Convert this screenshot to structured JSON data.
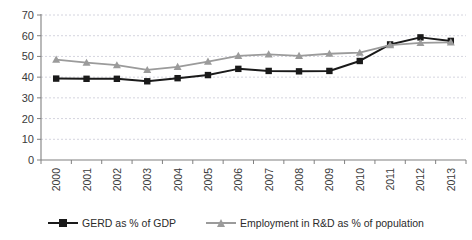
{
  "chart_data": {
    "type": "line",
    "title": "",
    "subtitle": "",
    "xlabel": "",
    "ylabel": "",
    "categories": [
      "2000",
      "2001",
      "2002",
      "2003",
      "2004",
      "2005",
      "2006",
      "2007",
      "2008",
      "2009",
      "2010",
      "2011",
      "2012",
      "2013"
    ],
    "x": [
      2000,
      2001,
      2002,
      2003,
      2004,
      2005,
      2006,
      2007,
      2008,
      2009,
      2010,
      2011,
      2012,
      2013
    ],
    "ylim": [
      0,
      70
    ],
    "yticks": [
      0,
      10,
      20,
      30,
      40,
      50,
      60,
      70
    ],
    "ytick_labels": [
      "0",
      "10",
      "20",
      "30",
      "40",
      "50",
      "60",
      "70"
    ],
    "grid": true,
    "grid_axis": "y",
    "legend_position": "bottom",
    "series": [
      {
        "name": "GERD as % of GDP",
        "color": "#1a1a1a",
        "marker": "square",
        "values": [
          39.3,
          39.2,
          39.2,
          38.0,
          39.5,
          41.0,
          44.0,
          43.0,
          42.8,
          43.0,
          47.8,
          55.8,
          59.2,
          57.5
        ]
      },
      {
        "name": "Employment in R&D as % of population",
        "color": "#9b9b9b",
        "marker": "triangle",
        "values": [
          48.5,
          47.0,
          45.8,
          43.5,
          45.0,
          47.5,
          50.3,
          51.0,
          50.3,
          51.3,
          51.8,
          55.5,
          56.5,
          56.8
        ]
      }
    ]
  },
  "legend": {
    "items": [
      {
        "label": "GERD as % of GDP",
        "color": "#1a1a1a",
        "marker": "square"
      },
      {
        "label": "Employment in R&D as % of population",
        "color": "#9b9b9b",
        "marker": "triangle"
      }
    ]
  },
  "colors": {
    "series_1": "#1a1a1a",
    "series_2": "#9b9b9b",
    "gridline": "#c9c9d6",
    "axis": "#808080",
    "background": "#ffffff",
    "text": "#333333"
  }
}
